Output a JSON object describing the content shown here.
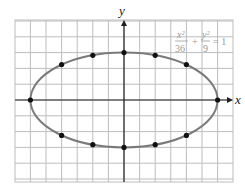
{
  "chart_data": {
    "type": "line",
    "title": "",
    "xlabel": "x",
    "ylabel": "y",
    "xlim": [
      -6.9,
      7.0
    ],
    "ylim": [
      -5.1,
      5.0
    ],
    "grid": true,
    "grid_step": 1,
    "curve": {
      "kind": "ellipse",
      "a": 6,
      "b": 3,
      "color": "#7a7a7a"
    },
    "equation": {
      "x_num": "x²",
      "x_den": "36",
      "plus": "+",
      "y_num": "y²",
      "y_den": "9",
      "rhs": "= 1"
    },
    "points": [
      {
        "x": -6,
        "y": 0
      },
      {
        "x": 6,
        "y": 0
      },
      {
        "x": 0,
        "y": 3
      },
      {
        "x": 0,
        "y": -3
      },
      {
        "x": -4,
        "y": 2.24
      },
      {
        "x": -2,
        "y": 2.83
      },
      {
        "x": 2,
        "y": 2.83
      },
      {
        "x": 4,
        "y": 2.24
      },
      {
        "x": -4,
        "y": -2.24
      },
      {
        "x": -2,
        "y": -2.83
      },
      {
        "x": 2,
        "y": -2.83
      },
      {
        "x": 4,
        "y": -2.24
      }
    ],
    "point_color": "#111111",
    "grid_color": "#bdbdbd",
    "axis_color": "#222222"
  }
}
